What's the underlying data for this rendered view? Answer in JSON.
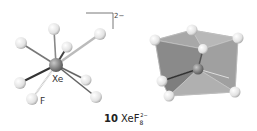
{
  "figure": {
    "number": "10",
    "formula": "XeF",
    "subscript": "8",
    "superscript": "2−",
    "charge_label": "2−",
    "labels": {
      "central_atom": "Xe",
      "ligand_atom": "F"
    },
    "ball_and_stick": {
      "center": [
        56,
        65
      ],
      "ligands": [
        [
          21,
          43
        ],
        [
          54,
          29
        ],
        [
          100,
          34
        ],
        [
          67,
          47
        ],
        [
          20,
          83
        ],
        [
          32,
          99
        ],
        [
          86,
          80
        ],
        [
          96,
          97
        ]
      ]
    },
    "polyhedron": {
      "center": [
        198,
        69
      ],
      "vertices": [
        [
          192,
          30
        ],
        [
          155,
          40
        ],
        [
          238,
          38
        ],
        [
          203,
          49
        ],
        [
          162,
          81
        ],
        [
          169,
          96
        ],
        [
          235,
          92
        ],
        [
          229,
          78
        ]
      ]
    },
    "colors": {
      "atom": "#f2f2f2",
      "atom_stroke": "#9a9a9a",
      "bond": "#7a7a7a",
      "xe": "#8a8a8a",
      "face": "#8c8c8c"
    }
  }
}
